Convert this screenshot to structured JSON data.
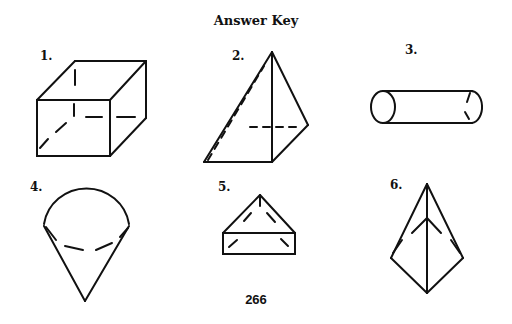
{
  "page": {
    "title": "Answer Key",
    "page_number": "266"
  },
  "figures": [
    {
      "label": "1.",
      "shape": "cube"
    },
    {
      "label": "2.",
      "shape": "pyramid"
    },
    {
      "label": "3.",
      "shape": "cylinder"
    },
    {
      "label": "4.",
      "shape": "cone"
    },
    {
      "label": "5.",
      "shape": "triangular-prism"
    },
    {
      "label": "6.",
      "shape": "triangular-pyramid"
    }
  ]
}
